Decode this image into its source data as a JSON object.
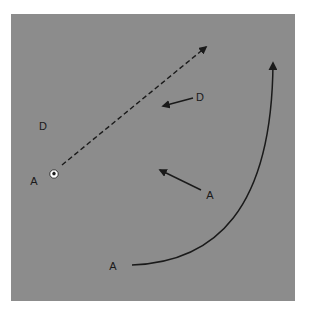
{
  "diagram": {
    "type": "soccer-tactics-play",
    "field": {
      "color": "#8c8c8c",
      "x": 11,
      "y": 14,
      "width": 284,
      "height": 287
    },
    "colors": {
      "line": "#1a1a1a",
      "label": "#1a1a1a"
    },
    "players": [
      {
        "role": "defender",
        "label": "D",
        "x": 200,
        "y": 101
      },
      {
        "role": "defender",
        "label": "D",
        "x": 43,
        "y": 130
      },
      {
        "role": "attacker",
        "label": "A",
        "x": 34,
        "y": 185
      },
      {
        "role": "attacker",
        "label": "A",
        "x": 210,
        "y": 199
      },
      {
        "role": "attacker",
        "label": "A",
        "x": 113,
        "y": 270
      }
    ],
    "ball": {
      "x": 54,
      "y": 174
    },
    "movements": [
      {
        "kind": "pass",
        "style": "dashed",
        "from": [
          62,
          165
        ],
        "to": [
          206,
          47
        ]
      },
      {
        "kind": "run",
        "style": "solid",
        "from": [
          193,
          98
        ],
        "to": [
          163,
          106
        ]
      },
      {
        "kind": "run",
        "style": "solid",
        "from": [
          201,
          190
        ],
        "to": [
          160,
          170
        ]
      },
      {
        "kind": "run",
        "style": "solid-curved",
        "from": [
          132,
          265
        ],
        "to": [
          273,
          63
        ]
      }
    ]
  }
}
